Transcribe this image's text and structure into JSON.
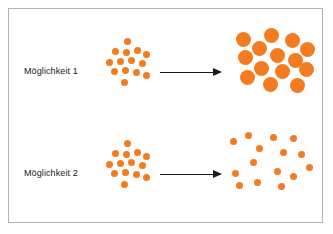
{
  "figure": {
    "width": 333,
    "height": 234,
    "background_color": "#ffffff",
    "border_color": "#b3b3b3",
    "dot_color": "#f47c20",
    "arrow_color": "#1a1a1a",
    "text_color": "#1a1a1a"
  },
  "rows": [
    {
      "id": "row-1",
      "label": "Möglichkeit 1",
      "arrow_icon": "arrow-right-icon",
      "before": {
        "name": "small-dot-cluster-dense",
        "dot_count": 14,
        "dot_diameter": 7,
        "dots": [
          {
            "x": 26,
            "y": 16
          },
          {
            "x": 14,
            "y": 26
          },
          {
            "x": 25,
            "y": 27
          },
          {
            "x": 36,
            "y": 25
          },
          {
            "x": 45,
            "y": 29
          },
          {
            "x": 8,
            "y": 37
          },
          {
            "x": 19,
            "y": 36
          },
          {
            "x": 30,
            "y": 35
          },
          {
            "x": 41,
            "y": 38
          },
          {
            "x": 13,
            "y": 46
          },
          {
            "x": 24,
            "y": 45
          },
          {
            "x": 35,
            "y": 47
          },
          {
            "x": 45,
            "y": 50
          },
          {
            "x": 23,
            "y": 57
          }
        ]
      },
      "after": {
        "name": "large-circle-cluster",
        "dot_count": 14,
        "dot_diameter": 15,
        "dots": [
          {
            "x": 8,
            "y": 10
          },
          {
            "x": 36,
            "y": 6
          },
          {
            "x": 57,
            "y": 11
          },
          {
            "x": 24,
            "y": 19
          },
          {
            "x": 72,
            "y": 20
          },
          {
            "x": 10,
            "y": 28
          },
          {
            "x": 42,
            "y": 26
          },
          {
            "x": 60,
            "y": 31
          },
          {
            "x": 26,
            "y": 39
          },
          {
            "x": 47,
            "y": 42
          },
          {
            "x": 71,
            "y": 40
          },
          {
            "x": 12,
            "y": 48
          },
          {
            "x": 35,
            "y": 55
          },
          {
            "x": 62,
            "y": 56
          }
        ]
      }
    },
    {
      "id": "row-2",
      "label": "Möglichkeit 2",
      "arrow_icon": "arrow-right-icon",
      "before": {
        "name": "small-dot-cluster-dense",
        "dot_count": 14,
        "dot_diameter": 7,
        "dots": [
          {
            "x": 26,
            "y": 14
          },
          {
            "x": 14,
            "y": 24
          },
          {
            "x": 25,
            "y": 25
          },
          {
            "x": 36,
            "y": 23
          },
          {
            "x": 45,
            "y": 27
          },
          {
            "x": 8,
            "y": 35
          },
          {
            "x": 19,
            "y": 34
          },
          {
            "x": 30,
            "y": 33
          },
          {
            "x": 41,
            "y": 36
          },
          {
            "x": 13,
            "y": 44
          },
          {
            "x": 24,
            "y": 43
          },
          {
            "x": 35,
            "y": 45
          },
          {
            "x": 45,
            "y": 48
          },
          {
            "x": 23,
            "y": 55
          }
        ]
      },
      "after": {
        "name": "small-dot-cluster-scattered",
        "dot_count": 15,
        "dot_diameter": 7,
        "dots": [
          {
            "x": 2,
            "y": 12
          },
          {
            "x": 17,
            "y": 6
          },
          {
            "x": 42,
            "y": 8
          },
          {
            "x": 62,
            "y": 9
          },
          {
            "x": 28,
            "y": 19
          },
          {
            "x": 52,
            "y": 23
          },
          {
            "x": 70,
            "y": 25
          },
          {
            "x": 22,
            "y": 33
          },
          {
            "x": 78,
            "y": 38
          },
          {
            "x": 4,
            "y": 44
          },
          {
            "x": 46,
            "y": 42
          },
          {
            "x": 62,
            "y": 47
          },
          {
            "x": 26,
            "y": 53
          },
          {
            "x": 50,
            "y": 57
          },
          {
            "x": 8,
            "y": 56
          }
        ]
      }
    }
  ]
}
